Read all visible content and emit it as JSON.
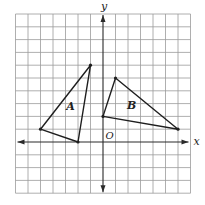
{
  "figure": {
    "axes": {
      "x_label": "x",
      "y_label": "y",
      "origin_label": "O",
      "x_range": [
        -7,
        7
      ],
      "y_range": [
        -4,
        10
      ],
      "grid_step": 1
    },
    "shapes": [
      {
        "label": "A",
        "vertices": [
          [
            -1,
            6
          ],
          [
            -5,
            1
          ],
          [
            -2,
            0
          ]
        ],
        "label_pos": [
          -2.6,
          2.5
        ]
      },
      {
        "label": "B",
        "vertices": [
          [
            1,
            5
          ],
          [
            0,
            2
          ],
          [
            6,
            1
          ]
        ],
        "label_pos": [
          2.3,
          2.6
        ]
      }
    ],
    "colors": {
      "grid": "#9a9a9a",
      "axis": "#2a2a2a",
      "shape": "#1e1e1e",
      "background": "#ffffff"
    }
  }
}
